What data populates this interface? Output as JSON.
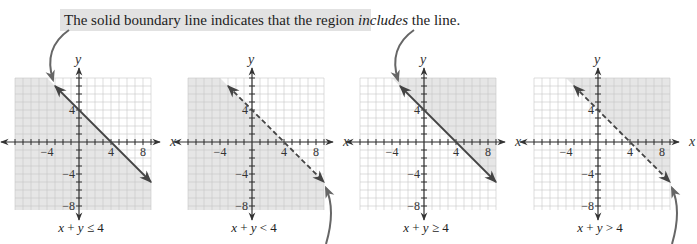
{
  "callout": {
    "text_before": "The solid boundary line indicates that the region ",
    "text_emphasis": "includes",
    "text_after": " the line.",
    "bg_color": "#e2e2e2"
  },
  "colors": {
    "shade": "#e6e6e6",
    "grid": "#c8c8c8",
    "axis": "#333333",
    "boundary": "#444444",
    "arrow_callout": "#666666"
  },
  "chart_data": [
    {
      "type": "region",
      "title": "x + y ≤ 4",
      "caption_parts": [
        "x",
        " + ",
        "y",
        " ≤ 4"
      ],
      "boundary": {
        "equation": "x + y = 4",
        "style": "solid",
        "from": [
          -3,
          7
        ],
        "to": [
          9,
          -5
        ]
      },
      "shaded_side": "below",
      "xlabel": "x",
      "ylabel": "y",
      "xticks": [
        -4,
        4,
        8
      ],
      "yticks": [
        4,
        -4,
        -8
      ],
      "xlim": [
        -8,
        9
      ],
      "ylim": [
        -8.5,
        8
      ],
      "callout_arrow": "top"
    },
    {
      "type": "region",
      "title": "x + y < 4",
      "caption_parts": [
        "x",
        " + ",
        "y",
        " < 4"
      ],
      "boundary": {
        "equation": "x + y = 4",
        "style": "dashed",
        "from": [
          -3,
          7
        ],
        "to": [
          9,
          -5
        ]
      },
      "shaded_side": "below",
      "xlabel": "x",
      "ylabel": "y",
      "xticks": [
        -4,
        4,
        8
      ],
      "yticks": [
        4,
        -4,
        -8
      ],
      "xlim": [
        -8,
        9
      ],
      "ylim": [
        -8.5,
        8
      ],
      "callout_arrow": "bottom"
    },
    {
      "type": "region",
      "title": "x + y ≥ 4",
      "caption_parts": [
        "x",
        " + ",
        "y",
        " ≥ 4"
      ],
      "boundary": {
        "equation": "x + y = 4",
        "style": "solid",
        "from": [
          -3,
          7
        ],
        "to": [
          9,
          -5
        ]
      },
      "shaded_side": "above",
      "xlabel": "x",
      "ylabel": "y",
      "xticks": [
        -4,
        4,
        8
      ],
      "yticks": [
        4,
        -4,
        -8
      ],
      "xlim": [
        -8,
        9
      ],
      "ylim": [
        -8.5,
        8
      ],
      "callout_arrow": "top"
    },
    {
      "type": "region",
      "title": "x + y > 4",
      "caption_parts": [
        "x",
        " + ",
        "y",
        " > 4"
      ],
      "boundary": {
        "equation": "x + y = 4",
        "style": "dashed",
        "from": [
          -3,
          7
        ],
        "to": [
          9,
          -5
        ]
      },
      "shaded_side": "above",
      "xlabel": "x",
      "ylabel": "y",
      "xticks": [
        -4,
        4,
        8
      ],
      "yticks": [
        4,
        -4,
        -8
      ],
      "xlim": [
        -8,
        9
      ],
      "ylim": [
        -8.5,
        8
      ],
      "callout_arrow": "bottom"
    }
  ],
  "layout": {
    "origins_x": [
      79,
      252,
      424,
      598
    ],
    "origin_y": 142,
    "unit": 8
  }
}
